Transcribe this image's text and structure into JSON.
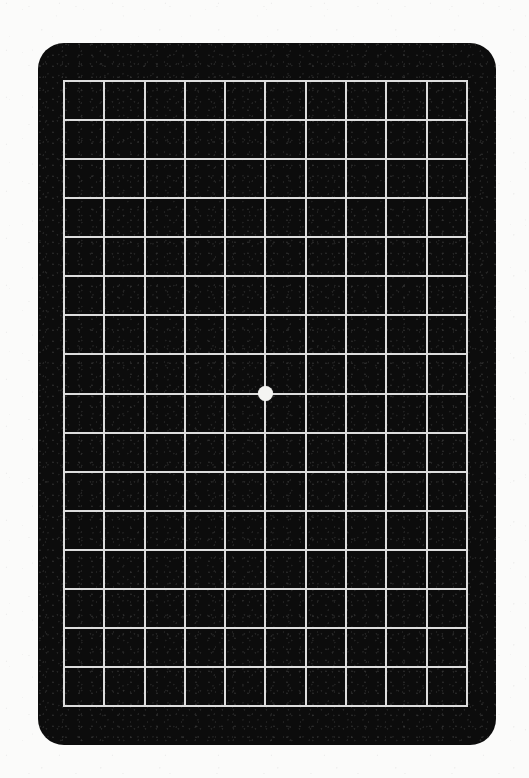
{
  "page": {
    "background_color": "#fbfbfa",
    "width": 529,
    "height": 778
  },
  "card": {
    "name": "amsler-grid-card",
    "background_color": "#0c0c0c",
    "corner_radius_px": 26,
    "left": 38,
    "top": 43,
    "width": 458,
    "height": 702
  },
  "grid": {
    "name": "amsler-grid",
    "columns": 10,
    "rows": 16,
    "line_color": "#dcdcdc",
    "line_width_px": 2,
    "cell_background_color": "#0d0d0d",
    "cell_width_px": 40.5,
    "cell_height_px": 39.2,
    "left": 63,
    "top": 80,
    "width": 405,
    "height": 627
  },
  "fixation_dot": {
    "name": "center-fixation-dot",
    "color": "#f4f4f2",
    "diameter_px": 15,
    "center_x": 265,
    "center_y": 393,
    "grid_column_index": 5,
    "grid_row_index": 8
  },
  "chart_data": {
    "type": "table",
    "xlabel": "",
    "ylabel": "",
    "grid": true,
    "legend_position": "none",
    "categories": [
      "c1",
      "c2",
      "c3",
      "c4",
      "c5",
      "c6",
      "c7",
      "c8",
      "c9",
      "c10"
    ],
    "values": [
      16,
      16,
      16,
      16,
      16,
      16,
      16,
      16,
      16,
      16
    ],
    "annotations": [
      {
        "label": "central fixation dot",
        "x": 5,
        "y": 8,
        "color": "#f4f4f2"
      }
    ]
  }
}
